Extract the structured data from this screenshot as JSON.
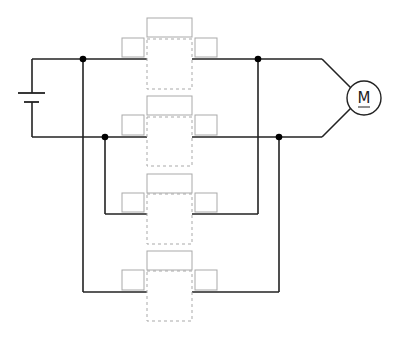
{
  "diagram": {
    "type": "circuit-schematic",
    "colors": {
      "wire": "#222222",
      "junction": "#000000",
      "placeholder": "#a9a9a9",
      "background": "#ffffff"
    },
    "battery": {
      "x": 32,
      "top_y": 59,
      "bottom_y": 137,
      "long_plate": {
        "y": 93,
        "x1": 18,
        "x2": 45
      },
      "short_plate": {
        "y": 102,
        "x1": 24,
        "x2": 39
      }
    },
    "motor": {
      "cx": 364,
      "cy": 98,
      "r": 17,
      "label": "M"
    },
    "junctions": [
      {
        "x": 83,
        "y": 59
      },
      {
        "x": 105,
        "y": 137
      },
      {
        "x": 258,
        "y": 59
      },
      {
        "x": 279,
        "y": 137
      }
    ],
    "switch_blocks": [
      {
        "id": 1,
        "wire_y": 59,
        "top_y": 18
      },
      {
        "id": 2,
        "wire_y": 137,
        "top_y": 96
      },
      {
        "id": 3,
        "wire_y": 214,
        "top_y": 174
      },
      {
        "id": 4,
        "wire_y": 292,
        "top_y": 251
      }
    ],
    "placeholders": {
      "block_label": "",
      "left_slot": "",
      "right_slot": ""
    }
  }
}
